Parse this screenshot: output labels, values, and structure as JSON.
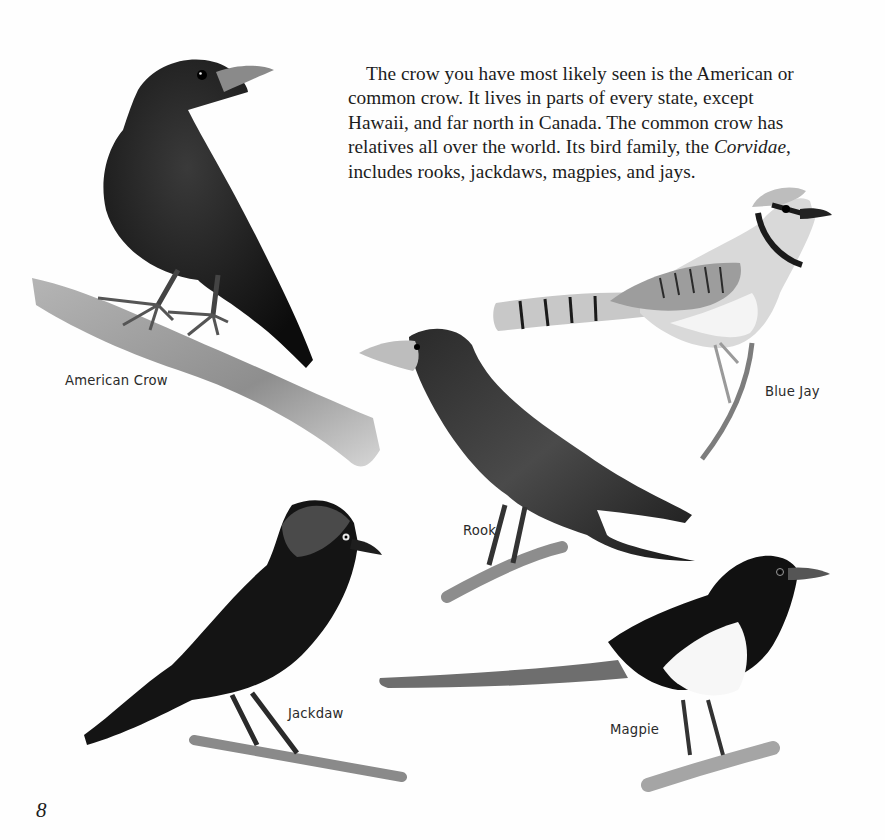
{
  "page": {
    "body_text": {
      "before_italic": "The crow you have most likely seen is the American or common crow. It lives in parts of every state, except Hawaii, and far north in Canada. The common crow has relatives all over the world. Its bird family, the ",
      "italic": "Corvidae",
      "after_italic": ", includes rooks, jackdaws, magpies, and jays."
    },
    "illustrations": [
      {
        "name": "American Crow",
        "caption": "American Crow",
        "icon": "crow-illustration"
      },
      {
        "name": "Blue Jay",
        "caption": "Blue Jay",
        "icon": "blue-jay-illustration"
      },
      {
        "name": "Rook",
        "caption": "Rook",
        "icon": "rook-illustration"
      },
      {
        "name": "Jackdaw",
        "caption": "Jackdaw",
        "icon": "jackdaw-illustration"
      },
      {
        "name": "Magpie",
        "caption": "Magpie",
        "icon": "magpie-illustration"
      }
    ],
    "page_number": "8"
  },
  "colors": {
    "background": "#fefefe",
    "text": "#1c1c1c",
    "caption": "#2a2a2a",
    "bird_black": "#141414",
    "branch_gray": "#9a9a9a"
  }
}
